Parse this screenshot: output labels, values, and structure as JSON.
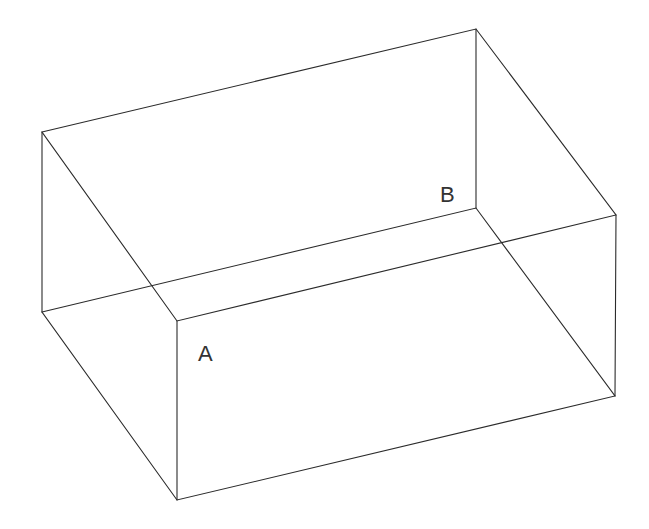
{
  "diagram": {
    "type": "wireframe-rectangular-box",
    "line_color": "#2b2b2b",
    "background": "#ffffff",
    "vertices": {
      "top_left_back": [
        42,
        132
      ],
      "top_right_back": [
        476,
        29
      ],
      "top_right_front": [
        616,
        215
      ],
      "top_left_front": [
        177,
        321
      ],
      "bottom_left_back": [
        42,
        312
      ],
      "bottom_right_back": [
        476,
        208
      ],
      "bottom_right_front": [
        615,
        396
      ],
      "bottom_left_front": [
        177,
        500
      ]
    },
    "labels": [
      {
        "id": "A",
        "text": "A",
        "x": 198,
        "y": 361
      },
      {
        "id": "B",
        "text": "B",
        "x": 440,
        "y": 202
      }
    ]
  }
}
